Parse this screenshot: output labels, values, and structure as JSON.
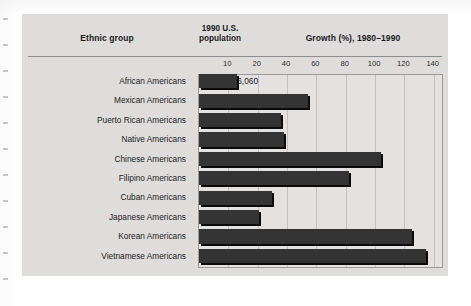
{
  "figure": {
    "headers": {
      "ethnic_group": "Ethnic group",
      "population_line1": "1990 U.S.",
      "population_line2": "population",
      "growth": "Growth (%), 1980–1990"
    }
  },
  "chart_data": {
    "type": "bar",
    "orientation": "horizontal",
    "title": "Growth (%), 1980–1990",
    "xlabel": "Growth (%), 1980–1990",
    "ylabel": "Ethnic group",
    "grid": true,
    "legend": "none",
    "tick_labels": [
      "10",
      "20",
      "40",
      "60",
      "80",
      "100",
      "120",
      "140"
    ],
    "tick_values": [
      10,
      20,
      40,
      60,
      80,
      100,
      120,
      140
    ],
    "axis_note": "Tick labels are spaced evenly on the drawn axis even though the numeric steps are uneven (10, 20, then by 20s).",
    "categories": [
      "African Americans",
      "Mexican Americans",
      "Puerto Rican Americans",
      "Native Americans",
      "Chinese Americans",
      "Filipino Americans",
      "Cuban Americans",
      "Japanese Americans",
      "Korean Americans",
      "Vietnamese Americans"
    ],
    "populations": [
      "29,986,060",
      "13,495,938",
      "2,727,754",
      "1,878,285",
      "1,645,472",
      "1,406,770",
      "1,043,932",
      "847,562",
      "798,849",
      "614,547"
    ],
    "values": [
      13,
      54,
      36,
      38,
      104,
      82,
      30,
      21,
      125,
      135
    ],
    "ylabel_right": "",
    "xlim": [
      0,
      140
    ]
  }
}
